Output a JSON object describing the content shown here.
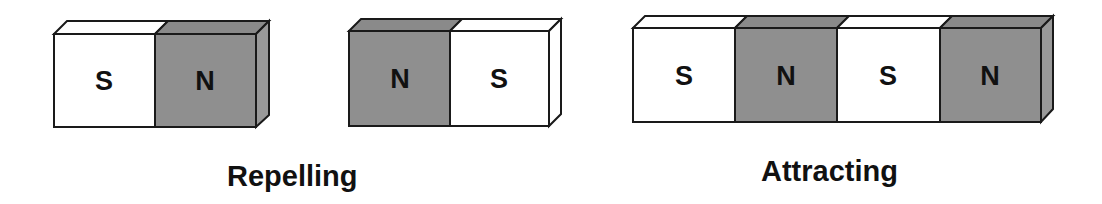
{
  "colors": {
    "north": "#8f8f8f",
    "north_top": "#8a8a8a",
    "north_side": "#999999",
    "south": "#ffffff",
    "outline": "#1a1a1a",
    "text": "#111111"
  },
  "groups": [
    {
      "name": "repelling",
      "caption": "Repelling",
      "magnets": [
        {
          "poles": [
            "S",
            "N"
          ]
        },
        {
          "poles": [
            "N",
            "S"
          ]
        }
      ]
    },
    {
      "name": "attracting",
      "caption": "Attracting",
      "magnets": [
        {
          "poles": [
            "S",
            "N"
          ]
        },
        {
          "poles": [
            "S",
            "N"
          ]
        }
      ]
    }
  ],
  "labels": {
    "m1_left": "S",
    "m1_right": "N",
    "m2_left": "N",
    "m2_right": "S",
    "m3_a": "S",
    "m3_b": "N",
    "m3_c": "S",
    "m3_d": "N",
    "repelling": "Repelling",
    "attracting": "Attracting"
  }
}
